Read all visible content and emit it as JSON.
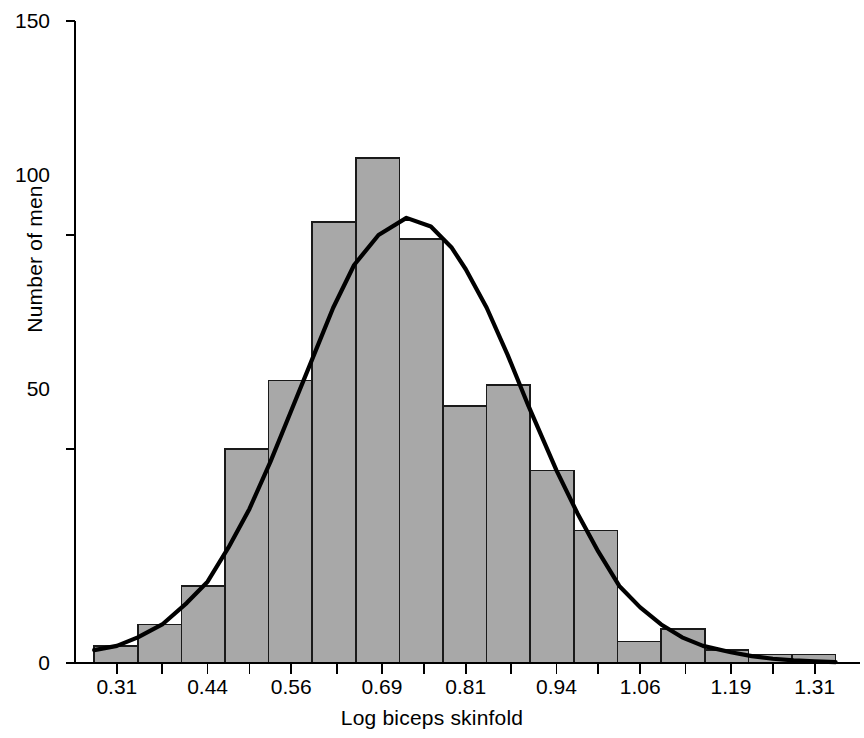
{
  "chart_data": {
    "type": "bar",
    "title": "",
    "subtitle": "",
    "xlabel": "Log biceps skinfold",
    "ylabel": "Number of men",
    "xlim": [
      0.25,
      1.375
    ],
    "ylim": [
      0,
      150
    ],
    "grid": false,
    "legend": null,
    "bin_width": 0.0625,
    "bin_edges": [
      0.2775,
      0.34,
      0.4025,
      0.465,
      0.5275,
      0.59,
      0.6525,
      0.715,
      0.7775,
      0.84,
      0.9025,
      0.965,
      1.0275,
      1.09,
      1.1525,
      1.215,
      1.2775,
      1.34
    ],
    "categories": [
      "0.28-0.34",
      "0.34-0.40",
      "0.40-0.47",
      "0.47-0.53",
      "0.53-0.59",
      "0.59-0.65",
      "0.65-0.72",
      "0.72-0.78",
      "0.78-0.84",
      "0.84-0.90",
      "0.90-0.97",
      "0.97-1.03",
      "1.03-1.09",
      "1.09-1.15",
      "1.15-1.22",
      "1.22-1.28",
      "1.28-1.34"
    ],
    "values": [
      4,
      9,
      18,
      50,
      66,
      103,
      118,
      99,
      60,
      65,
      45,
      31,
      5,
      8,
      3,
      2,
      2
    ],
    "series": [
      {
        "name": "Number of men",
        "type": "bar",
        "values": [
          4,
          9,
          18,
          50,
          66,
          103,
          118,
          99,
          60,
          65,
          45,
          31,
          5,
          8,
          3,
          2,
          2
        ]
      },
      {
        "name": "fitted normal curve",
        "type": "line",
        "peak_y": 104,
        "peak_x": 0.725,
        "mean": 0.725,
        "sd": 0.155,
        "points_x": [
          0.2775,
          0.31,
          0.34,
          0.375,
          0.41,
          0.44,
          0.47,
          0.5,
          0.53,
          0.56,
          0.59,
          0.62,
          0.65,
          0.685,
          0.725,
          0.76,
          0.79,
          0.81,
          0.84,
          0.87,
          0.9,
          0.94,
          0.97,
          1.0,
          1.03,
          1.06,
          1.09,
          1.12,
          1.15,
          1.19,
          1.22,
          1.25,
          1.28,
          1.31,
          1.34
        ],
        "points_y": [
          3,
          4,
          6,
          9,
          14,
          19,
          27,
          36,
          47,
          59,
          71,
          83,
          93,
          100,
          104,
          102,
          97,
          92,
          83,
          72,
          60,
          45,
          35,
          26,
          18,
          13,
          9,
          6,
          4,
          2.5,
          1.6,
          1.0,
          0.6,
          0.4,
          0.2
        ]
      }
    ],
    "yticks": [
      0,
      50,
      100,
      150
    ],
    "ytick_labels": [
      "0",
      "50",
      "100",
      "150"
    ],
    "xticks": [
      0.31,
      0.375,
      0.44,
      0.5,
      0.56,
      0.625,
      0.69,
      0.75,
      0.81,
      0.875,
      0.94,
      1.0,
      1.06,
      1.125,
      1.19,
      1.25,
      1.31
    ],
    "xtick_labels": [
      "0.31",
      "0.44",
      "0.56",
      "0.69",
      "0.81",
      "0.94",
      "1.06",
      "1.19",
      "1.31"
    ],
    "xtick_labeled_values": [
      0.31,
      0.44,
      0.56,
      0.69,
      0.81,
      0.94,
      1.06,
      1.19,
      1.31
    ],
    "colors": {
      "bar_fill": "#a8a8a8",
      "bar_stroke": "#1a1a1a",
      "curve": "#000000",
      "axis": "#000000",
      "background": "#ffffff"
    }
  },
  "axes": {
    "y_label": "Number of men",
    "x_label": "Log biceps skinfold",
    "y_tick_labels": [
      "150",
      "100",
      "50",
      "0"
    ],
    "x_tick_labels": [
      "0.31",
      "0.44",
      "0.56",
      "0.69",
      "0.81",
      "0.94",
      "1.06",
      "1.19",
      "1.31"
    ]
  }
}
